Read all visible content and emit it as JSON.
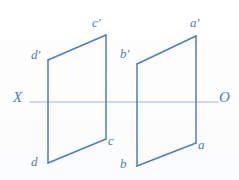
{
  "figure": {
    "background_color": "#fdfdfd",
    "line_color": "#4a7fc1",
    "axis_color": "#9db9da",
    "label_color": "#4a7fc1"
  },
  "axis": {
    "left_label": "X",
    "right_label": "O",
    "y": 102,
    "x_start": 30,
    "x_end": 218
  },
  "shapes": [
    {
      "id": "left-quadrilateral",
      "name": "quadrilateral-dcdc",
      "upper_vertices": [
        {
          "label": "d'",
          "x": 48,
          "y": 60
        },
        {
          "label": "c'",
          "x": 106,
          "y": 35
        }
      ],
      "lower_vertices": [
        {
          "label": "d",
          "x": 48,
          "y": 163
        },
        {
          "label": "c",
          "x": 106,
          "y": 139
        }
      ]
    },
    {
      "id": "right-quadrilateral",
      "name": "quadrilateral-abab",
      "upper_vertices": [
        {
          "label": "b'",
          "x": 137,
          "y": 64
        },
        {
          "label": "a'",
          "x": 196,
          "y": 36
        }
      ],
      "lower_vertices": [
        {
          "label": "b",
          "x": 137,
          "y": 166
        },
        {
          "label": "a",
          "x": 196,
          "y": 143
        }
      ]
    }
  ],
  "labels": [
    {
      "key": "d-prime",
      "text": "d'",
      "x": 31,
      "y": 48
    },
    {
      "key": "c-prime",
      "text": "c'",
      "x": 92,
      "y": 16
    },
    {
      "key": "b-prime",
      "text": "b'",
      "x": 120,
      "y": 47
    },
    {
      "key": "a-prime",
      "text": "a'",
      "x": 190,
      "y": 16
    },
    {
      "key": "c",
      "text": "c",
      "x": 108,
      "y": 134
    },
    {
      "key": "a",
      "text": "a",
      "x": 198,
      "y": 138
    },
    {
      "key": "d",
      "text": "d",
      "x": 31,
      "y": 155
    },
    {
      "key": "b",
      "text": "b",
      "x": 120,
      "y": 157
    },
    {
      "key": "x-axis",
      "text": "X",
      "x": 13,
      "y": 90
    },
    {
      "key": "o-axis",
      "text": "O",
      "x": 219,
      "y": 90
    }
  ]
}
